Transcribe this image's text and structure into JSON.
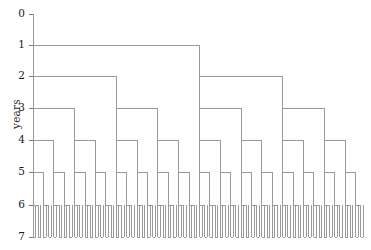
{
  "figure": {
    "type": "binary-branching-tree-diagram",
    "width": 371,
    "height": 250,
    "background_color": "#ffffff",
    "line_color": "#9a9a9a",
    "axis_color": "#7a7a7a",
    "text_color": "#1a1a1a"
  },
  "axis": {
    "title": "years",
    "orientation": "vertical",
    "direction": "downward",
    "tick_labels": [
      "0",
      "1",
      "2",
      "3",
      "4",
      "5",
      "6",
      "7"
    ],
    "tick_values": [
      0,
      1,
      2,
      3,
      4,
      5,
      6,
      7
    ],
    "tick_pixel_y": [
      14,
      45,
      76,
      108,
      140,
      172,
      205,
      237
    ],
    "range": [
      0,
      7
    ]
  },
  "chart_data": {
    "type": "tree",
    "title": "",
    "xlabel": "",
    "ylabel": "years",
    "levels": 8,
    "branching_factor": 2,
    "nodes_per_level": [
      1,
      2,
      4,
      8,
      16,
      32,
      64,
      128
    ],
    "root_pixel_x": 33,
    "plot_left": 33,
    "plot_right": 366,
    "levels_detail": [
      {
        "year": 0,
        "y": 14,
        "node_count": 1
      },
      {
        "year": 1,
        "y": 45,
        "node_count": 2
      },
      {
        "year": 2,
        "y": 76,
        "node_count": 4
      },
      {
        "year": 3,
        "y": 108,
        "node_count": 8
      },
      {
        "year": 4,
        "y": 140,
        "node_count": 16
      },
      {
        "year": 5,
        "y": 172,
        "node_count": 32
      },
      {
        "year": 6,
        "y": 205,
        "node_count": 64
      },
      {
        "year": 7,
        "y": 237,
        "node_count": 128
      }
    ]
  }
}
